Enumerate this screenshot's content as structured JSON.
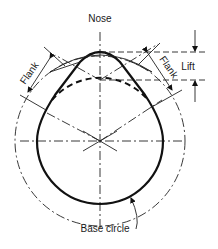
{
  "diagram": {
    "labels": {
      "nose": "Nose",
      "flank_left": "Flank",
      "flank_right": "Flank",
      "lift": "Lift",
      "base_circle": "Base circle"
    },
    "colors": {
      "line": "#111111",
      "background": "#ffffff"
    }
  }
}
